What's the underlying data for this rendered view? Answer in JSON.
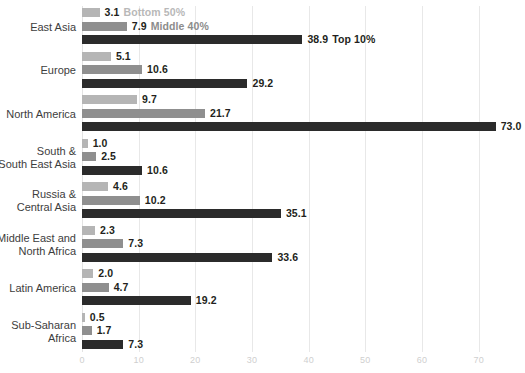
{
  "chart_data": {
    "type": "bar",
    "orientation": "horizontal",
    "grouped": true,
    "title": "",
    "subtitle": "",
    "xlabel": "",
    "ylabel": "",
    "xlim": [
      0,
      75
    ],
    "xticks": [
      0,
      10,
      20,
      30,
      40,
      50,
      60,
      70
    ],
    "xtick_labels": [
      "0",
      "10",
      "20",
      "30",
      "40",
      "50",
      "60",
      "70"
    ],
    "grid": "vertical",
    "legend_position": "inline-first-group",
    "categories": [
      "East Asia",
      "Europe",
      "North America",
      "South &\nSouth East Asia",
      "Russia &\nCentral Asia",
      "Middle East and\nNorth Africa",
      "Latin America",
      "Sub-Saharan\nAfrica"
    ],
    "series": [
      {
        "name": "Bottom 50%",
        "color": "#b5b5b5",
        "label_color": "#b8b8b8",
        "values": [
          3.1,
          5.1,
          9.7,
          1.0,
          4.6,
          2.3,
          2.0,
          0.5
        ],
        "value_labels": [
          "3.1",
          "5.1",
          "9.7",
          "1.0",
          "4.6",
          "2.3",
          "2.0",
          "0.5"
        ]
      },
      {
        "name": "Middle 40%",
        "color": "#8f8f8f",
        "label_color": "#8c8c8c",
        "values": [
          7.9,
          10.6,
          21.7,
          2.5,
          10.2,
          7.3,
          4.7,
          1.7
        ],
        "value_labels": [
          "7.9",
          "10.6",
          "21.7",
          "2.5",
          "10.2",
          "7.3",
          "4.7",
          "1.7"
        ]
      },
      {
        "name": "Top 10%",
        "color": "#2b2b2b",
        "label_color": "#231f20",
        "values": [
          38.9,
          29.2,
          73.0,
          10.6,
          35.1,
          33.6,
          19.2,
          7.3
        ],
        "value_labels": [
          "38.9",
          "29.2",
          "73.0",
          "10.6",
          "35.1",
          "33.6",
          "19.2",
          "7.3"
        ]
      }
    ]
  },
  "legend": {
    "items": [
      {
        "label": "Bottom 50%",
        "color": "#b5b5b5"
      },
      {
        "label": "Middle 40%",
        "color": "#8f8f8f"
      },
      {
        "label": "Top 10%",
        "color": "#2b2b2b"
      }
    ]
  },
  "colors": {
    "background": "#ffffff",
    "gridline": "#e8e8e8",
    "tick_text": "#cfcfcf",
    "category_text": "#3d3d3d",
    "value_text": "#231f20"
  }
}
